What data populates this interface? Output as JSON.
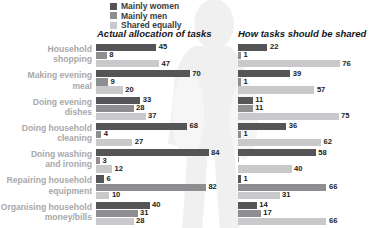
{
  "legend": {
    "items": [
      {
        "label": "Mainly women",
        "color": "#555558",
        "key": "mainly_women"
      },
      {
        "label": "Mainly men",
        "color": "#8e8e91",
        "key": "mainly_men"
      },
      {
        "label": "Shared equally",
        "color": "#c9c9cb",
        "key": "shared_equally"
      }
    ]
  },
  "panels": {
    "left_title": "Actual allocation of tasks",
    "right_title": "How tasks should be shared"
  },
  "categories": [
    "Household\nshopping",
    "Making evening\nmeal",
    "Doing evening\ndishes",
    "Doing household\ncleaning",
    "Doing washing\nand ironing",
    "Repairing household\nequipment",
    "Organising household\nmoney/bills"
  ],
  "chart_data": [
    {
      "type": "bar",
      "orientation": "horizontal",
      "title": "Actual allocation of tasks",
      "xlabel": "",
      "ylabel": "",
      "xlim": [
        0,
        100
      ],
      "grid": false,
      "legend_position": "top-left",
      "categories": [
        "Household shopping",
        "Making evening meal",
        "Doing evening dishes",
        "Doing household cleaning",
        "Doing washing and ironing",
        "Repairing household equipment",
        "Organising household money/bills"
      ],
      "series": [
        {
          "name": "Mainly women",
          "values": [
            45,
            70,
            33,
            68,
            84,
            6,
            40
          ]
        },
        {
          "name": "Mainly men",
          "values": [
            8,
            9,
            28,
            4,
            3,
            82,
            31
          ]
        },
        {
          "name": "Shared equally",
          "values": [
            47,
            20,
            37,
            27,
            12,
            10,
            28
          ]
        }
      ]
    },
    {
      "type": "bar",
      "orientation": "horizontal",
      "title": "How tasks should be shared",
      "xlabel": "",
      "ylabel": "",
      "xlim": [
        0,
        100
      ],
      "grid": false,
      "legend_position": "top-left",
      "categories": [
        "Household shopping",
        "Making evening meal",
        "Doing evening dishes",
        "Doing household cleaning",
        "Doing washing and ironing",
        "Repairing household equipment",
        "Organising household money/bills"
      ],
      "series": [
        {
          "name": "Mainly women",
          "values": [
            22,
            39,
            11,
            36,
            58,
            1,
            14
          ]
        },
        {
          "name": "Mainly men",
          "values": [
            1,
            1,
            11,
            1,
            0,
            66,
            17
          ]
        },
        {
          "name": "Shared equally",
          "values": [
            76,
            57,
            75,
            62,
            40,
            31,
            66
          ]
        }
      ]
    }
  ],
  "value_labels": {
    "left": [
      [
        "45",
        "8",
        "47"
      ],
      [
        "70",
        "9",
        "20"
      ],
      [
        "33",
        "28",
        "37"
      ],
      [
        "68",
        "4",
        "27"
      ],
      [
        "84",
        "3",
        "12"
      ],
      [
        "6",
        "82",
        "10"
      ],
      [
        "40",
        "31",
        "28"
      ]
    ],
    "right": [
      [
        "22",
        "1",
        "76"
      ],
      [
        "39",
        "1",
        "57"
      ],
      [
        "11",
        "11",
        "75"
      ],
      [
        "36",
        "1",
        "62"
      ],
      [
        "58",
        "",
        "40"
      ],
      [
        "1",
        "66",
        "31"
      ],
      [
        "14",
        "17",
        "66"
      ]
    ]
  }
}
